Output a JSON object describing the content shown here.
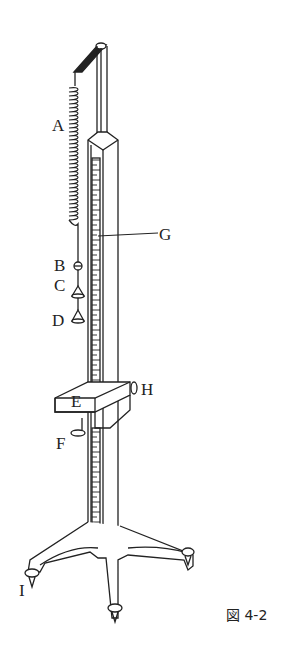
{
  "figure": {
    "caption": "図 4-2"
  },
  "labels": {
    "A": "A",
    "B": "B",
    "C": "C",
    "D": "D",
    "E": "E",
    "F": "F",
    "G": "G",
    "H": "H",
    "I": "I"
  },
  "colors": {
    "line": "#222222",
    "background": "#ffffff"
  }
}
